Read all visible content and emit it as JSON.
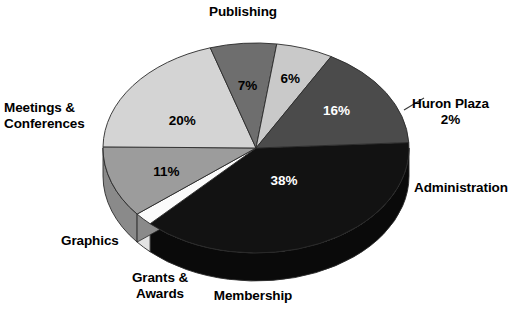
{
  "chart_data": {
    "type": "pie",
    "title": "",
    "subtitle": "",
    "xlabel": "",
    "ylabel": "",
    "legend_position": "none",
    "grid": false,
    "style": "3d-pie",
    "units": "percent",
    "categories": [
      "Publishing",
      "Huron Plaza",
      "Administration",
      "Membership",
      "Grants & Awards",
      "Graphics",
      "Meetings & Conferences"
    ],
    "values": [
      38,
      2,
      11,
      20,
      7,
      6,
      16
    ],
    "slices": [
      {
        "label": "Publishing",
        "label_lines": "Publishing",
        "value": 38,
        "value_text": "38%",
        "color": "#121212",
        "side_color": "#0a0a0a",
        "text_color": "#ffffff"
      },
      {
        "label": "Huron Plaza",
        "label_lines": "Huron Plaza\n2%",
        "value": 2,
        "value_text": "2%",
        "color": "#fbfbfb",
        "side_color": "#e3e3e3",
        "text_color": "#000000"
      },
      {
        "label": "Administration",
        "label_lines": "Administration",
        "value": 11,
        "value_text": "11%",
        "color": "#9c9c9c",
        "side_color": "#8a8a8a",
        "text_color": "#000000"
      },
      {
        "label": "Membership",
        "label_lines": "Membership",
        "value": 20,
        "value_text": "20%",
        "color": "#d4d4d4",
        "side_color": "#c3c3c3",
        "text_color": "#000000"
      },
      {
        "label": "Grants & Awards",
        "label_lines": "Grants &\nAwards",
        "value": 7,
        "value_text": "7%",
        "color": "#6e6e6e",
        "side_color": "#5e5e5e",
        "text_color": "#000000"
      },
      {
        "label": "Graphics",
        "label_lines": "Graphics",
        "value": 6,
        "value_text": "6%",
        "color": "#c9c9c9",
        "side_color": "#b8b8b8",
        "text_color": "#000000"
      },
      {
        "label": "Meetings & Conferences",
        "label_lines": "Meetings &\nConferences",
        "value": 16,
        "value_text": "16%",
        "color": "#4b4b4b",
        "side_color": "#3d3d3d",
        "text_color": "#ffffff"
      }
    ],
    "percent_labels": {
      "publishing": "38%",
      "huron_plaza": "2%",
      "administration": "11%",
      "membership": "20%",
      "grants_awards": "7%",
      "graphics": "6%",
      "meetings_conferences": "16%"
    },
    "category_labels": {
      "publishing": "Publishing",
      "huron_plaza_line1": "Huron Plaza",
      "huron_plaza_line2": "2%",
      "administration": "Administration",
      "membership": "Membership",
      "grants_line1": "Grants &",
      "grants_line2": "Awards",
      "graphics": "Graphics",
      "meetings_line1": "Meetings &",
      "meetings_line2": "Conferences"
    },
    "colors": {
      "background": "#ffffff",
      "text": "#000000",
      "outline": "#2a2a2a",
      "leader_line": "#3a3a3a"
    }
  }
}
